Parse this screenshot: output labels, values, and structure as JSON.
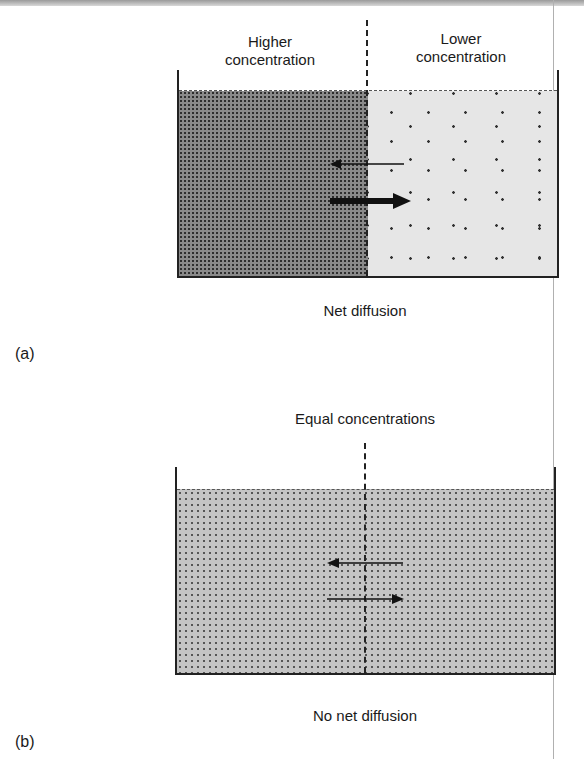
{
  "figure": {
    "panel_a": {
      "letter": "(a)",
      "left_label_line1": "Higher",
      "left_label_line2": "concentration",
      "right_label_line1": "Lower",
      "right_label_line2": "concentration",
      "caption": "Net diffusion",
      "arrows": [
        {
          "direction": "left",
          "weight": "thin"
        },
        {
          "direction": "right",
          "weight": "thick"
        }
      ]
    },
    "panel_b": {
      "letter": "(b)",
      "title": "Equal concentrations",
      "caption": "No net diffusion",
      "arrows": [
        {
          "direction": "left",
          "weight": "thin"
        },
        {
          "direction": "right",
          "weight": "thin"
        }
      ]
    },
    "colors": {
      "high_concentration_fill": "#8a8a8a",
      "low_concentration_fill": "#e6e6e6",
      "equal_concentration_fill": "#c4c4c4",
      "ink": "#1a1a1a"
    }
  }
}
